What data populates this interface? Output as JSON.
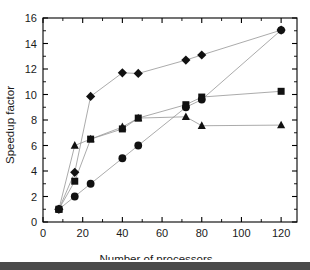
{
  "chart_data": {
    "type": "line",
    "title": "",
    "subtitle": "",
    "xlabel": "Number of processors",
    "ylabel": "Speedup factor",
    "xlim": [
      0,
      128
    ],
    "ylim": [
      0,
      16
    ],
    "xticks": [
      0,
      20,
      40,
      60,
      80,
      100,
      120
    ],
    "yticks": [
      0,
      2,
      4,
      6,
      8,
      10,
      12,
      14,
      16
    ],
    "xtick_labels": [
      "0",
      "20",
      "40",
      "60",
      "80",
      "100",
      "120"
    ],
    "ytick_labels": [
      "0",
      "2",
      "4",
      "6",
      "8",
      "10",
      "12",
      "14",
      "16"
    ],
    "grid": false,
    "legend": "none",
    "marker_color": "#111111",
    "line_color": "#8f8f8f",
    "axis_color": "#000000",
    "series": [
      {
        "name": "diamond-series",
        "marker": "diamond",
        "x": [
          8,
          16,
          24,
          40,
          48,
          72,
          80,
          120
        ],
        "values": [
          1.0,
          3.9,
          9.85,
          11.7,
          11.65,
          12.7,
          13.1,
          15.05
        ]
      },
      {
        "name": "square-series",
        "marker": "square",
        "x": [
          8,
          16,
          24,
          40,
          48,
          72,
          80,
          120
        ],
        "values": [
          1.0,
          3.2,
          6.5,
          7.3,
          8.15,
          9.2,
          9.8,
          10.25
        ]
      },
      {
        "name": "circle-series",
        "marker": "circle",
        "x": [
          8,
          16,
          24,
          40,
          48,
          72,
          80,
          120
        ],
        "values": [
          1.0,
          2.0,
          3.0,
          5.0,
          6.0,
          9.0,
          9.6,
          15.05
        ]
      },
      {
        "name": "triangle-series",
        "marker": "triangle",
        "x": [
          8,
          16,
          24,
          40,
          48,
          72,
          80,
          120
        ],
        "values": [
          1.0,
          6.0,
          6.5,
          7.45,
          8.15,
          8.25,
          7.55,
          7.6
        ]
      }
    ]
  }
}
